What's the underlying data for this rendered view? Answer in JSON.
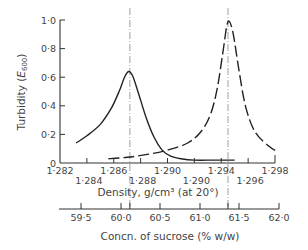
{
  "chart_data": {
    "type": "line",
    "title": "",
    "xlabel": "Density, g/cm³ (at 20°)",
    "ylabel": "Turbidity (E600)",
    "ylabel_main": "Turbidity (",
    "ylabel_italic": "E",
    "ylabel_sub": "600",
    "ylabel_close": ")",
    "secondary_xlabel": "Concn. of sucrose (% w/w)",
    "xlim": [
      1.282,
      1.298
    ],
    "ylim": [
      0,
      1.0
    ],
    "grid": false,
    "legend": null,
    "y_ticks": [
      {
        "value": 0,
        "label": "0"
      },
      {
        "value": 0.2,
        "label": "0·2"
      },
      {
        "value": 0.4,
        "label": "0·4"
      },
      {
        "value": 0.6,
        "label": "0·6"
      },
      {
        "value": 0.8,
        "label": "0·8"
      },
      {
        "value": 1.0,
        "label": "1·0"
      }
    ],
    "x_ticks_upper_row": [
      {
        "value": 1.282,
        "label": "1·282"
      },
      {
        "value": 1.286,
        "label": "1·286"
      },
      {
        "value": 1.29,
        "label": "1·290"
      },
      {
        "value": 1.294,
        "label": "1·294"
      },
      {
        "value": 1.298,
        "label": "1·298"
      }
    ],
    "x_ticks_lower_row": [
      {
        "value": 1.284,
        "label": "1·284"
      },
      {
        "value": 1.288,
        "label": "1·288"
      },
      {
        "value": 1.292,
        "label": "1·290"
      },
      {
        "value": 1.296,
        "label": "1·296"
      }
    ],
    "secondary_x_ticks": [
      {
        "px": 81,
        "label": "59·5"
      },
      {
        "px": 121,
        "label": "60·0"
      },
      {
        "px": 160,
        "label": "60·5"
      },
      {
        "px": 200,
        "label": "61·0"
      },
      {
        "px": 239,
        "label": "61·5"
      },
      {
        "px": 279,
        "label": "62·0"
      }
    ],
    "reference_lines": [
      {
        "x": 1.2872,
        "style": "dash-dot",
        "label": "peak of solid curve"
      },
      {
        "x": 1.2945,
        "style": "dash-dot",
        "label": "peak of dashed curve"
      }
    ],
    "series": [
      {
        "name": "solid",
        "style": "solid",
        "x": [
          1.2832,
          1.284,
          1.285,
          1.2858,
          1.2864,
          1.2868,
          1.2871,
          1.2874,
          1.2878,
          1.2884,
          1.289,
          1.2896,
          1.2902,
          1.291,
          1.292,
          1.2935,
          1.295
        ],
        "y": [
          0.14,
          0.19,
          0.27,
          0.38,
          0.5,
          0.6,
          0.64,
          0.61,
          0.5,
          0.32,
          0.18,
          0.09,
          0.05,
          0.03,
          0.02,
          0.02,
          0.02
        ]
      },
      {
        "name": "dashed",
        "style": "dashed",
        "x": [
          1.2856,
          1.287,
          1.2885,
          1.29,
          1.2915,
          1.2925,
          1.2932,
          1.2937,
          1.2941,
          1.2944,
          1.2946,
          1.2949,
          1.2953,
          1.2958,
          1.2965,
          1.2975,
          1.2982
        ],
        "y": [
          0.03,
          0.04,
          0.06,
          0.09,
          0.14,
          0.22,
          0.34,
          0.52,
          0.76,
          0.95,
          0.99,
          0.9,
          0.66,
          0.4,
          0.22,
          0.12,
          0.08
        ]
      }
    ]
  },
  "axes": {
    "y_title_text": "Turbidity (",
    "y_title_italic": "E",
    "y_title_sub": "600",
    "y_title_close": ")",
    "x_title": "Density, g/cm³ (at 20°)",
    "x2_title": "Concn. of sucrose (% w/w)"
  },
  "colors": {
    "ink": "#222222",
    "axis": "#333333",
    "guide": "#888888"
  }
}
